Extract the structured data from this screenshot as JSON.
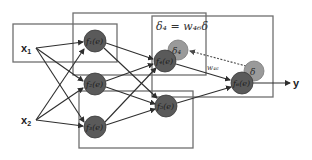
{
  "diagram": {
    "inputs": [
      {
        "id": "x1",
        "label": "x",
        "sub": "1",
        "x": 38,
        "y": 48
      },
      {
        "id": "x2",
        "label": "x",
        "sub": "2",
        "x": 38,
        "y": 120
      }
    ],
    "output": {
      "label": "y",
      "x": 298,
      "y": 83
    },
    "neurons": [
      {
        "id": "n1",
        "label": "f₁(e)",
        "x": 95,
        "y": 41
      },
      {
        "id": "n2",
        "label": "f₂(e)",
        "x": 95,
        "y": 84
      },
      {
        "id": "n3",
        "label": "f₃(e)",
        "x": 95,
        "y": 127
      },
      {
        "id": "n4",
        "label": "f₄(e)",
        "x": 165,
        "y": 61
      },
      {
        "id": "n5",
        "label": "f₅(e)",
        "x": 166,
        "y": 106
      },
      {
        "id": "n6",
        "label": "f₆(e)",
        "x": 242,
        "y": 83
      }
    ],
    "error_nodes": [
      {
        "id": "d4",
        "label": "δ₄",
        "x": 178,
        "y": 50
      },
      {
        "id": "d",
        "label": "δ",
        "x": 254,
        "y": 71
      }
    ],
    "equation": "δ₄ = w₄₆δ",
    "weight_label": "w₄₆",
    "colors": {
      "neuron": "#5a5a5a",
      "error_node": "#9a9a9a",
      "box": "#6f6f6f",
      "edge": "#2e2e2e"
    }
  }
}
